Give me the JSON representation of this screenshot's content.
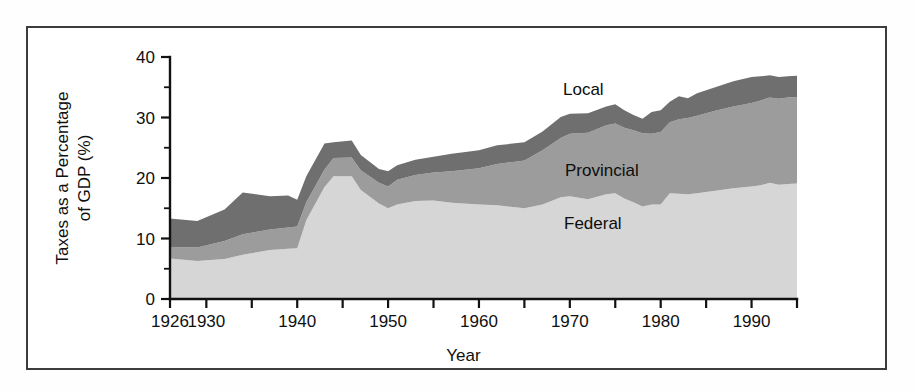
{
  "figure": {
    "border_color": "#3c3c3c",
    "background": "#ffffff"
  },
  "chart_data": {
    "type": "area",
    "stacked": true,
    "title": "",
    "xlabel": "Year",
    "ylabel": "Taxes as a Percentage of GDP (%)",
    "ylabel_line1": "Taxes as a Percentage",
    "ylabel_line2": "of GDP (%)",
    "xlim": [
      1926,
      1995
    ],
    "ylim": [
      0,
      40
    ],
    "grid": false,
    "legend_position": "inline-annotations",
    "y_ticks_major": [
      0,
      10,
      20,
      30,
      40
    ],
    "y_ticks_minor": [
      5,
      15,
      25,
      35
    ],
    "y_tick_labels": [
      "0",
      "10",
      "20",
      "30",
      "40"
    ],
    "x_ticks": [
      1926,
      1930,
      1935,
      1940,
      1945,
      1950,
      1955,
      1960,
      1965,
      1970,
      1975,
      1980,
      1985,
      1990,
      1995
    ],
    "x_tick_labels_shown": [
      "1926",
      "1930",
      "1940",
      "1950",
      "1960",
      "1970",
      "1980",
      "1990"
    ],
    "x_tick_label_years": [
      1926,
      1930,
      1940,
      1950,
      1960,
      1970,
      1980,
      1990
    ],
    "x": [
      1926,
      1929,
      1932,
      1934,
      1937,
      1939,
      1940,
      1941,
      1943,
      1944,
      1946,
      1947,
      1949,
      1950,
      1951,
      1953,
      1955,
      1957,
      1960,
      1962,
      1965,
      1967,
      1969,
      1970,
      1972,
      1974,
      1975,
      1976,
      1977,
      1978,
      1979,
      1980,
      1981,
      1982,
      1983,
      1984,
      1986,
      1988,
      1990,
      1991,
      1992,
      1993,
      1994,
      1995
    ],
    "series": [
      {
        "name": "Federal",
        "color": "#d6d6d6",
        "values": [
          6.7,
          6.3,
          6.6,
          7.3,
          8.1,
          8.3,
          8.4,
          13.0,
          18.5,
          20.3,
          20.3,
          18.0,
          15.8,
          15.0,
          15.6,
          16.2,
          16.3,
          15.9,
          15.6,
          15.5,
          15.0,
          15.6,
          16.8,
          17.0,
          16.5,
          17.3,
          17.5,
          16.6,
          16.0,
          15.3,
          15.6,
          15.6,
          17.5,
          17.4,
          17.3,
          17.5,
          17.9,
          18.3,
          18.6,
          18.8,
          19.2,
          18.9,
          19.0,
          19.1
        ]
      },
      {
        "name": "Provincial",
        "color": "#9c9c9c",
        "values": [
          1.9,
          2.2,
          3.0,
          3.4,
          3.4,
          3.5,
          3.6,
          3.0,
          2.9,
          3.0,
          3.1,
          3.3,
          3.4,
          3.6,
          4.1,
          4.3,
          4.6,
          5.2,
          6.0,
          6.8,
          7.9,
          9.0,
          9.8,
          10.3,
          11.0,
          11.4,
          11.5,
          11.7,
          11.9,
          12.1,
          11.7,
          12.0,
          11.7,
          12.3,
          12.6,
          12.8,
          13.2,
          13.5,
          13.8,
          14.0,
          14.1,
          14.2,
          14.3,
          14.3
        ]
      },
      {
        "name": "Local",
        "color": "#6f6f6f",
        "values": [
          4.7,
          4.4,
          5.2,
          6.9,
          5.5,
          5.3,
          4.4,
          4.3,
          4.3,
          2.6,
          2.8,
          2.5,
          2.3,
          2.5,
          2.4,
          2.5,
          2.6,
          2.9,
          3.0,
          3.1,
          3.0,
          3.1,
          3.5,
          3.3,
          3.2,
          3.1,
          3.2,
          2.9,
          2.5,
          2.4,
          3.6,
          3.6,
          3.4,
          3.8,
          3.3,
          3.7,
          3.9,
          4.2,
          4.3,
          4.0,
          3.7,
          3.6,
          3.5,
          3.5
        ]
      }
    ],
    "annotations": [
      {
        "text": "Local",
        "series": "Local",
        "x_px": 565,
        "y_px": 95
      },
      {
        "text": "Provincial",
        "series": "Provincial",
        "x_px": 567,
        "y_px": 176
      },
      {
        "text": "Federal",
        "series": "Federal",
        "x_px": 566,
        "y_px": 229
      }
    ]
  }
}
